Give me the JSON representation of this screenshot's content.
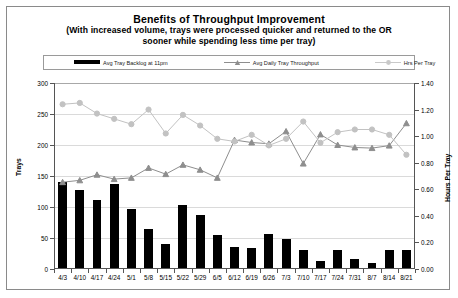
{
  "chart_data": {
    "type": "bar",
    "title": "Benefits of Throughput Improvement",
    "subtitle_line1": "(With increased volume, trays were processed quicker and returned to the OR",
    "subtitle_line2": "sooner while spending less time per tray)",
    "xlabel": "",
    "ylabel": "Trays",
    "y2label": "Hours Per Tray",
    "ylim": [
      0,
      300
    ],
    "y2lim": [
      0,
      1.4
    ],
    "ytick_labels": [
      "0",
      "50",
      "100",
      "150",
      "200",
      "250",
      "300"
    ],
    "ytick_values": [
      0,
      50,
      100,
      150,
      200,
      250,
      300
    ],
    "y2tick_labels": [
      "0.00",
      "0.20",
      "0.40",
      "0.60",
      "0.80",
      "1.00",
      "1.20",
      "1.40"
    ],
    "y2tick_values": [
      0,
      0.2,
      0.4,
      0.6,
      0.8,
      1.0,
      1.2,
      1.4
    ],
    "grid": true,
    "legend_position": "top",
    "categories": [
      "4/3",
      "4/10",
      "4/17",
      "4/24",
      "5/1",
      "5/8",
      "5/15",
      "5/22",
      "5/29",
      "6/5",
      "6/12",
      "6/19",
      "6/26",
      "7/3",
      "7/10",
      "7/17",
      "7/24",
      "7/31",
      "8/7",
      "8/14",
      "8/21"
    ],
    "series": [
      {
        "name": "Avg Tray Backlog at 11pm",
        "type": "bar",
        "axis": "left",
        "color": "#000000",
        "values": [
          140,
          127,
          112,
          137,
          96,
          65,
          40,
          103,
          87,
          55,
          35,
          34,
          57,
          48,
          30,
          13,
          30,
          16,
          10,
          30,
          31
        ]
      },
      {
        "name": "Avg Daily Tray Throughput",
        "type": "line",
        "axis": "left",
        "color": "#8e8e8e",
        "marker": "triangle",
        "values": [
          140,
          143,
          152,
          145,
          147,
          163,
          153,
          168,
          160,
          147,
          208,
          204,
          202,
          222,
          170,
          217,
          200,
          196,
          195,
          199,
          235
        ]
      },
      {
        "name": "Hrs Per Tray",
        "type": "line",
        "axis": "right",
        "color": "#c2c2c2",
        "marker": "circle",
        "values": [
          1.24,
          1.25,
          1.17,
          1.13,
          1.09,
          1.2,
          1.02,
          1.16,
          1.08,
          0.98,
          0.96,
          1.01,
          0.93,
          0.98,
          1.11,
          0.95,
          1.03,
          1.05,
          1.05,
          1.01,
          0.86
        ]
      }
    ]
  },
  "legend": {
    "items": [
      {
        "label": "Avg Tray Backlog at 11pm"
      },
      {
        "label": "Avg Daily Tray Throughput"
      },
      {
        "label": "Hrs Per Tray"
      }
    ]
  }
}
